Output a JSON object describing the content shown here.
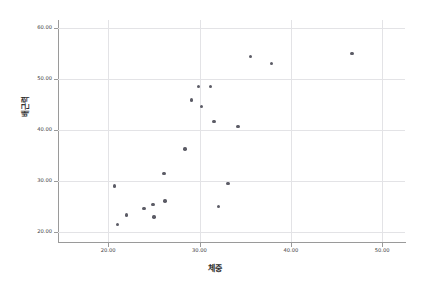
{
  "chart_data": {
    "type": "scatter",
    "title": "",
    "xlabel": "체중",
    "ylabel": "배근력",
    "xlim": [
      14.5,
      52.5
    ],
    "ylim": [
      18.0,
      61.5
    ],
    "xticks": [
      20.0,
      30.0,
      40.0,
      50.0
    ],
    "yticks": [
      20.0,
      30.0,
      40.0,
      50.0,
      60.0
    ],
    "xtick_labels": [
      "20.00",
      "30.00",
      "40.00",
      "50.00"
    ],
    "ytick_labels": [
      "20.00",
      "30.00",
      "40.00",
      "50.00",
      "60.00"
    ],
    "grid": true,
    "legend": false,
    "marker_color": "#5c5c66",
    "gridline_color": "#e3e3e6",
    "axis_color": "#9a9a9a",
    "background_color": "#ffffff",
    "points": [
      {
        "x": 20.7,
        "y": 29.0
      },
      {
        "x": 21.0,
        "y": 21.4
      },
      {
        "x": 22.0,
        "y": 23.3
      },
      {
        "x": 23.9,
        "y": 24.6
      },
      {
        "x": 24.9,
        "y": 25.4
      },
      {
        "x": 25.0,
        "y": 22.9
      },
      {
        "x": 26.2,
        "y": 26.0
      },
      {
        "x": 26.1,
        "y": 31.4
      },
      {
        "x": 28.4,
        "y": 36.2
      },
      {
        "x": 29.1,
        "y": 45.8
      },
      {
        "x": 29.9,
        "y": 48.5
      },
      {
        "x": 30.2,
        "y": 44.5
      },
      {
        "x": 31.2,
        "y": 48.5
      },
      {
        "x": 31.6,
        "y": 41.6
      },
      {
        "x": 32.1,
        "y": 25.0
      },
      {
        "x": 33.1,
        "y": 29.5
      },
      {
        "x": 34.2,
        "y": 40.6
      },
      {
        "x": 35.6,
        "y": 54.4
      },
      {
        "x": 37.9,
        "y": 53.0
      },
      {
        "x": 46.7,
        "y": 54.9
      }
    ]
  }
}
